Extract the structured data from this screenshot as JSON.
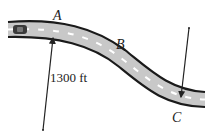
{
  "figure": {
    "type": "curved-road-diagram",
    "points": [
      {
        "id": "A",
        "label": "A"
      },
      {
        "id": "B",
        "label": "B"
      },
      {
        "id": "C",
        "label": "C"
      }
    ],
    "radius_label": "1300 ft",
    "colors": {
      "road_fill": "#c8c8c8",
      "road_edge": "#1a1a1a",
      "lane_marks": "#ffffff",
      "arrow": "#222222",
      "text": "#222222"
    },
    "icons": [
      "car-icon",
      "radius-arrow-icon"
    ]
  }
}
